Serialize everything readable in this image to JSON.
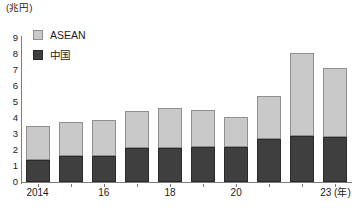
{
  "chart_data": {
    "type": "bar",
    "subtype": "stacked-vertical",
    "title": "",
    "subtitle": "",
    "xlabel": "(年)",
    "ylabel": "(兆円)",
    "unit_caption": "(兆円)",
    "x_unit_suffix": "(年)",
    "categories": [
      "2014",
      "2015",
      "2016",
      "2017",
      "2018",
      "2019",
      "2020",
      "2021",
      "2022",
      "2023"
    ],
    "x_tick_labels": [
      "2014",
      "",
      "16",
      "",
      "18",
      "",
      "20",
      "",
      "",
      "23 (年)"
    ],
    "ylim": [
      0,
      9
    ],
    "y_ticks": [
      "0",
      "1",
      "2",
      "3",
      "4",
      "5",
      "6",
      "7",
      "8",
      "9"
    ],
    "grid": false,
    "legend_position": "top-left",
    "series": [
      {
        "name": "中国",
        "color": "#3f3f3f",
        "values": [
          1.35,
          1.6,
          1.65,
          2.1,
          2.15,
          2.2,
          2.2,
          2.7,
          2.85,
          2.8
        ]
      },
      {
        "name": "ASEAN",
        "color": "#c9c9c9",
        "values": [
          2.15,
          2.15,
          2.2,
          2.35,
          2.45,
          2.3,
          1.85,
          2.7,
          5.2,
          4.35
        ]
      }
    ],
    "totals": [
      3.5,
      3.75,
      3.85,
      4.45,
      4.6,
      4.5,
      4.05,
      5.4,
      8.05,
      7.15
    ]
  },
  "legend": {
    "items": [
      {
        "label": "ASEAN",
        "swatch": "asean"
      },
      {
        "label": "中国",
        "swatch": "china"
      }
    ]
  },
  "colors": {
    "asean": "#c9c9c9",
    "china": "#3f3f3f",
    "axis": "#7d7d7d",
    "text": "#1a1a1a",
    "background": "#ffffff"
  }
}
